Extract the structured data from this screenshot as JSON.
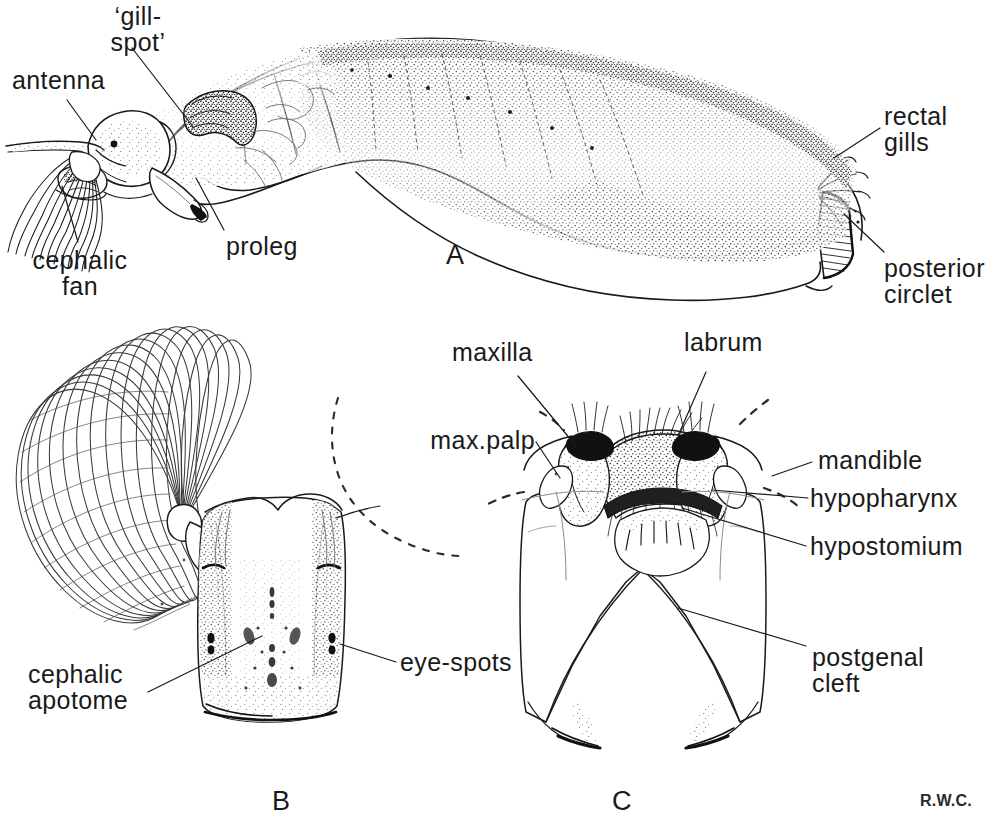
{
  "figure": {
    "background_color": "#ffffff",
    "ink_color": "#1a1a1a",
    "signature": "R.W.C.",
    "width": 991,
    "height": 820
  },
  "panels": [
    {
      "id": "A",
      "label": "A",
      "caption": "whole larva, lateral view"
    },
    {
      "id": "B",
      "label": "B",
      "caption": "head capsule, dorsal view with cephalic fan"
    },
    {
      "id": "C",
      "label": "C",
      "caption": "head capsule, ventral view showing mouthparts"
    }
  ],
  "labels": {
    "a": [
      {
        "name": "gill-spot",
        "text": "‘gill-\nspot’"
      },
      {
        "name": "antenna",
        "text": "antenna"
      },
      {
        "name": "cephalic-fan",
        "text": "cephalic\nfan"
      },
      {
        "name": "proleg",
        "text": "proleg"
      },
      {
        "name": "rectal-gills",
        "text": "rectal\ngills"
      },
      {
        "name": "posterior-circlet",
        "text": "posterior\ncirclet"
      }
    ],
    "b": [
      {
        "name": "cephalic-apotome",
        "text": "cephalic\napotome"
      },
      {
        "name": "eye-spots",
        "text": "eye-spots"
      }
    ],
    "c": [
      {
        "name": "maxilla",
        "text": "maxilla"
      },
      {
        "name": "labrum",
        "text": "labrum"
      },
      {
        "name": "max-palp",
        "text": "max.palp"
      },
      {
        "name": "mandible",
        "text": "mandible"
      },
      {
        "name": "hypopharynx",
        "text": "hypopharynx"
      },
      {
        "name": "hypostomium",
        "text": "hypostomium"
      },
      {
        "name": "postgenal-cleft",
        "text": "postgenal\ncleft"
      }
    ]
  }
}
